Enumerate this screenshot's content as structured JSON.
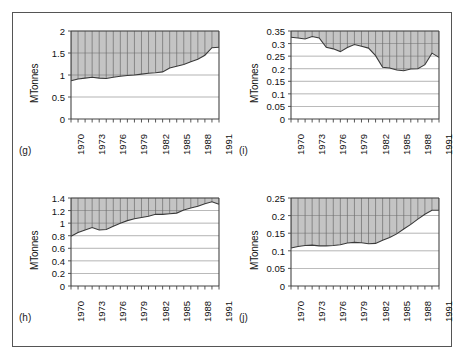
{
  "figure": {
    "colors": {
      "fill": "#c4c4c4",
      "grid": "#6b6b6b",
      "line": "#3a3a3a",
      "axis": "#444444",
      "text": "#111111",
      "frame": "#555555"
    },
    "panels": [
      {
        "tag": "(g)",
        "chart_data": {
          "type": "area",
          "title": "",
          "subtitle": "",
          "xlabel": "",
          "ylabel": "MTonnes",
          "xlim": [
            1970,
            1991
          ],
          "ylim": [
            0,
            2
          ],
          "yticks": [
            0,
            0.5,
            1,
            1.5,
            2
          ],
          "ytick_labels": [
            "0",
            "0.5",
            "1",
            "1.5",
            "2"
          ],
          "xticks": [
            1970,
            1973,
            1976,
            1979,
            1982,
            1985,
            1988,
            1991
          ],
          "xtick_labels": [
            "1970",
            "1973",
            "1976",
            "1979",
            "1982",
            "1985",
            "1988",
            "1991"
          ],
          "grid": true,
          "fill_above_line": true,
          "legend": null,
          "x": [
            1970,
            1971,
            1972,
            1973,
            1974,
            1975,
            1976,
            1977,
            1978,
            1979,
            1980,
            1981,
            1982,
            1983,
            1984,
            1985,
            1986,
            1987,
            1988,
            1989,
            1990,
            1991
          ],
          "values": [
            0.87,
            0.91,
            0.93,
            0.95,
            0.93,
            0.92,
            0.95,
            0.97,
            0.99,
            1.0,
            1.02,
            1.04,
            1.05,
            1.07,
            1.16,
            1.2,
            1.24,
            1.3,
            1.36,
            1.45,
            1.62,
            1.63
          ]
        }
      },
      {
        "tag": "(i)",
        "chart_data": {
          "type": "area",
          "title": "",
          "subtitle": "",
          "xlabel": "",
          "ylabel": "MTonnes",
          "xlim": [
            1970,
            1991
          ],
          "ylim": [
            0,
            0.35
          ],
          "yticks": [
            0,
            0.05,
            0.1,
            0.15,
            0.2,
            0.25,
            0.3,
            0.35
          ],
          "ytick_labels": [
            "0",
            "0.05",
            "0.1",
            "0.15",
            "0.2",
            "0.25",
            "0.3",
            "0.35"
          ],
          "xticks": [
            1970,
            1973,
            1976,
            1979,
            1982,
            1985,
            1988,
            1991
          ],
          "xtick_labels": [
            "1970",
            "1973",
            "1976",
            "1979",
            "1982",
            "1985",
            "1988",
            "1991"
          ],
          "grid": true,
          "fill_above_line": true,
          "legend": null,
          "x": [
            1970,
            1971,
            1972,
            1973,
            1974,
            1975,
            1976,
            1977,
            1978,
            1979,
            1980,
            1981,
            1982,
            1983,
            1984,
            1985,
            1986,
            1987,
            1988,
            1989,
            1990,
            1991
          ],
          "values": [
            0.325,
            0.322,
            0.318,
            0.328,
            0.322,
            0.285,
            0.279,
            0.268,
            0.284,
            0.296,
            0.289,
            0.282,
            0.252,
            0.206,
            0.203,
            0.195,
            0.192,
            0.199,
            0.2,
            0.216,
            0.262,
            0.245
          ]
        }
      },
      {
        "tag": "(h)",
        "chart_data": {
          "type": "area",
          "title": "",
          "subtitle": "",
          "xlabel": "",
          "ylabel": "MTonnes",
          "xlim": [
            1970,
            1991
          ],
          "ylim": [
            0,
            1.4
          ],
          "yticks": [
            0,
            0.2,
            0.4,
            0.6,
            0.8,
            1,
            1.2,
            1.4
          ],
          "ytick_labels": [
            "0",
            "0.2",
            "0.4",
            "0.6",
            "0.8",
            "1",
            "1.2",
            "1.4"
          ],
          "xticks": [
            1970,
            1973,
            1976,
            1979,
            1982,
            1985,
            1988,
            1991
          ],
          "xtick_labels": [
            "1970",
            "1973",
            "1976",
            "1979",
            "1982",
            "1985",
            "1988",
            "1991"
          ],
          "grid": true,
          "fill_above_line": true,
          "legend": null,
          "x": [
            1970,
            1971,
            1972,
            1973,
            1974,
            1975,
            1976,
            1977,
            1978,
            1979,
            1980,
            1981,
            1982,
            1983,
            1984,
            1985,
            1986,
            1987,
            1988,
            1989,
            1990,
            1991
          ],
          "values": [
            0.79,
            0.85,
            0.89,
            0.93,
            0.89,
            0.9,
            0.95,
            1.0,
            1.04,
            1.07,
            1.09,
            1.11,
            1.14,
            1.14,
            1.15,
            1.16,
            1.21,
            1.24,
            1.27,
            1.31,
            1.34,
            1.3
          ]
        }
      },
      {
        "tag": "(j)",
        "chart_data": {
          "type": "area",
          "title": "",
          "subtitle": "",
          "xlabel": "",
          "ylabel": "MTonnes",
          "xlim": [
            1970,
            1991
          ],
          "ylim": [
            0,
            0.25
          ],
          "yticks": [
            0,
            0.05,
            0.1,
            0.15,
            0.2,
            0.25
          ],
          "ytick_labels": [
            "0",
            "0.05",
            "0.1",
            "0.15",
            "0.2",
            "0.25"
          ],
          "xticks": [
            1970,
            1973,
            1976,
            1979,
            1982,
            1985,
            1988,
            1991
          ],
          "xtick_labels": [
            "1970",
            "1973",
            "1976",
            "1979",
            "1982",
            "1985",
            "1988",
            "1991"
          ],
          "grid": true,
          "fill_above_line": true,
          "legend": null,
          "x": [
            1970,
            1971,
            1972,
            1973,
            1974,
            1975,
            1976,
            1977,
            1978,
            1979,
            1980,
            1981,
            1982,
            1983,
            1984,
            1985,
            1986,
            1987,
            1988,
            1989,
            1990,
            1991
          ],
          "values": [
            0.108,
            0.112,
            0.115,
            0.116,
            0.114,
            0.114,
            0.115,
            0.117,
            0.122,
            0.124,
            0.123,
            0.12,
            0.121,
            0.13,
            0.138,
            0.148,
            0.162,
            0.175,
            0.19,
            0.204,
            0.215,
            0.215
          ]
        }
      }
    ]
  }
}
